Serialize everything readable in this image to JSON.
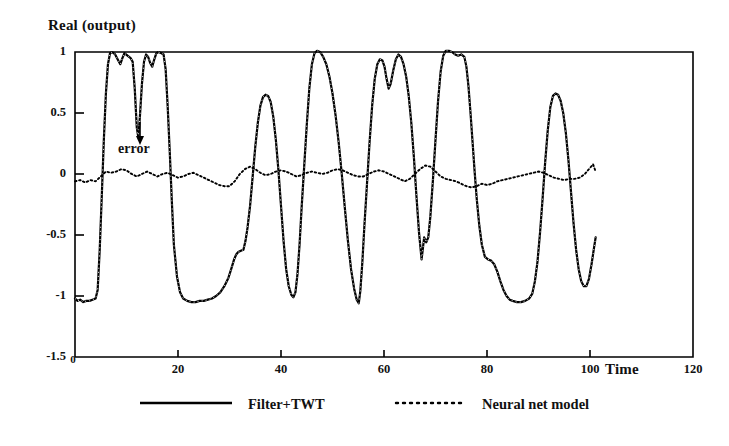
{
  "chart_data": {
    "type": "line",
    "title": "",
    "ylabel": "Real (output)",
    "xlabel": "Time",
    "xlim": [
      0,
      120
    ],
    "ylim": [
      -1.5,
      1.0
    ],
    "xticks": [
      "0",
      "20",
      "40",
      "60",
      "80",
      "100",
      "120"
    ],
    "xtick_values": [
      0,
      20,
      40,
      60,
      80,
      100,
      120
    ],
    "yticks": [
      "1",
      "0.5",
      "0",
      "-0.5",
      "-1",
      "-1.5"
    ],
    "ytick_values": [
      1,
      0.5,
      0,
      -0.5,
      -1,
      -1.5
    ],
    "grid": false,
    "legend_position": "below-axes",
    "annotations": [
      {
        "text": "error",
        "x": 8.5,
        "y": 0.25,
        "points_to": "error-curve"
      }
    ],
    "series": [
      {
        "name": "Filter+TWT",
        "style": "solid",
        "color": "#000000",
        "points": [
          [
            0.0,
            -1.02
          ],
          [
            0.5,
            -1.04
          ],
          [
            1.0,
            -1.03
          ],
          [
            1.6,
            -1.05
          ],
          [
            2.2,
            -1.04
          ],
          [
            2.8,
            -1.04
          ],
          [
            3.4,
            -1.03
          ],
          [
            4.0,
            -1.02
          ],
          [
            4.4,
            -0.95
          ],
          [
            4.8,
            -0.62
          ],
          [
            5.2,
            -0.18
          ],
          [
            5.6,
            0.28
          ],
          [
            6.0,
            0.66
          ],
          [
            6.4,
            0.9
          ],
          [
            6.8,
            0.99
          ],
          [
            7.2,
            1.0
          ],
          [
            7.8,
            0.98
          ],
          [
            8.4,
            0.93
          ],
          [
            8.8,
            0.9
          ],
          [
            9.2,
            0.95
          ],
          [
            9.6,
            0.99
          ],
          [
            10.2,
            0.97
          ],
          [
            10.8,
            0.95
          ],
          [
            11.2,
            0.92
          ],
          [
            11.6,
            0.7
          ],
          [
            12.0,
            0.38
          ],
          [
            12.3,
            0.3
          ],
          [
            12.6,
            0.47
          ],
          [
            13.0,
            0.74
          ],
          [
            13.4,
            0.92
          ],
          [
            13.8,
            0.98
          ],
          [
            14.2,
            0.96
          ],
          [
            14.6,
            0.91
          ],
          [
            15.0,
            0.88
          ],
          [
            15.4,
            0.94
          ],
          [
            15.8,
            0.99
          ],
          [
            16.2,
            1.0
          ],
          [
            16.8,
            0.99
          ],
          [
            17.2,
            0.98
          ],
          [
            17.6,
            0.86
          ],
          [
            18.0,
            0.55
          ],
          [
            18.4,
            0.18
          ],
          [
            18.8,
            -0.22
          ],
          [
            19.2,
            -0.58
          ],
          [
            19.8,
            -0.84
          ],
          [
            20.4,
            -0.97
          ],
          [
            21.0,
            -1.02
          ],
          [
            21.8,
            -1.04
          ],
          [
            22.6,
            -1.05
          ],
          [
            23.4,
            -1.05
          ],
          [
            24.2,
            -1.04
          ],
          [
            25.0,
            -1.04
          ],
          [
            25.8,
            -1.03
          ],
          [
            26.6,
            -1.02
          ],
          [
            27.4,
            -1.0
          ],
          [
            28.2,
            -0.97
          ],
          [
            29.0,
            -0.92
          ],
          [
            29.8,
            -0.85
          ],
          [
            30.4,
            -0.77
          ],
          [
            30.9,
            -0.7
          ],
          [
            31.3,
            -0.66
          ],
          [
            31.7,
            -0.64
          ],
          [
            32.2,
            -0.63
          ],
          [
            32.7,
            -0.62
          ],
          [
            33.1,
            -0.55
          ],
          [
            33.5,
            -0.44
          ],
          [
            34.0,
            -0.26
          ],
          [
            34.5,
            -0.02
          ],
          [
            35.0,
            0.22
          ],
          [
            35.5,
            0.42
          ],
          [
            36.0,
            0.56
          ],
          [
            36.5,
            0.63
          ],
          [
            37.0,
            0.65
          ],
          [
            37.5,
            0.64
          ],
          [
            38.0,
            0.59
          ],
          [
            38.5,
            0.47
          ],
          [
            39.0,
            0.28
          ],
          [
            39.5,
            0.03
          ],
          [
            40.0,
            -0.26
          ],
          [
            40.5,
            -0.55
          ],
          [
            41.0,
            -0.78
          ],
          [
            41.5,
            -0.92
          ],
          [
            42.0,
            -0.99
          ],
          [
            42.4,
            -1.01
          ],
          [
            42.8,
            -0.97
          ],
          [
            43.2,
            -0.82
          ],
          [
            43.6,
            -0.58
          ],
          [
            44.0,
            -0.28
          ],
          [
            44.5,
            0.06
          ],
          [
            45.0,
            0.4
          ],
          [
            45.5,
            0.7
          ],
          [
            46.0,
            0.9
          ],
          [
            46.5,
            0.99
          ],
          [
            47.0,
            1.01
          ],
          [
            47.6,
            1.0
          ],
          [
            48.2,
            0.96
          ],
          [
            48.8,
            0.9
          ],
          [
            49.4,
            0.8
          ],
          [
            50.0,
            0.66
          ],
          [
            50.6,
            0.48
          ],
          [
            51.2,
            0.26
          ],
          [
            51.8,
            0.0
          ],
          [
            52.4,
            -0.28
          ],
          [
            53.0,
            -0.55
          ],
          [
            53.6,
            -0.78
          ],
          [
            54.2,
            -0.94
          ],
          [
            54.7,
            -1.03
          ],
          [
            55.1,
            -1.06
          ],
          [
            55.4,
            -0.96
          ],
          [
            55.8,
            -0.72
          ],
          [
            56.2,
            -0.42
          ],
          [
            56.7,
            -0.08
          ],
          [
            57.2,
            0.26
          ],
          [
            57.7,
            0.56
          ],
          [
            58.2,
            0.78
          ],
          [
            58.7,
            0.9
          ],
          [
            59.2,
            0.94
          ],
          [
            59.7,
            0.93
          ],
          [
            60.1,
            0.88
          ],
          [
            60.5,
            0.78
          ],
          [
            60.9,
            0.7
          ],
          [
            61.3,
            0.74
          ],
          [
            61.8,
            0.85
          ],
          [
            62.3,
            0.94
          ],
          [
            62.8,
            0.98
          ],
          [
            63.3,
            0.96
          ],
          [
            63.8,
            0.9
          ],
          [
            64.3,
            0.8
          ],
          [
            64.8,
            0.64
          ],
          [
            65.3,
            0.42
          ],
          [
            65.8,
            0.14
          ],
          [
            66.3,
            -0.18
          ],
          [
            66.8,
            -0.48
          ],
          [
            67.3,
            -0.7
          ],
          [
            67.8,
            -0.52
          ],
          [
            68.2,
            -0.56
          ],
          [
            68.6,
            -0.52
          ],
          [
            69.0,
            -0.35
          ],
          [
            69.5,
            -0.05
          ],
          [
            70.0,
            0.28
          ],
          [
            70.5,
            0.6
          ],
          [
            71.0,
            0.84
          ],
          [
            71.5,
            0.97
          ],
          [
            72.0,
            1.01
          ],
          [
            72.6,
            1.01
          ],
          [
            73.2,
            1.0
          ],
          [
            73.8,
            0.98
          ],
          [
            74.4,
            0.97
          ],
          [
            75.0,
            0.98
          ],
          [
            75.6,
            0.96
          ],
          [
            76.0,
            0.88
          ],
          [
            76.4,
            0.72
          ],
          [
            76.8,
            0.5
          ],
          [
            77.2,
            0.26
          ],
          [
            77.6,
            0.02
          ],
          [
            78.0,
            -0.2
          ],
          [
            78.5,
            -0.42
          ],
          [
            79.0,
            -0.58
          ],
          [
            79.6,
            -0.68
          ],
          [
            80.2,
            -0.7
          ],
          [
            80.8,
            -0.71
          ],
          [
            81.4,
            -0.74
          ],
          [
            82.0,
            -0.8
          ],
          [
            82.6,
            -0.88
          ],
          [
            83.2,
            -0.95
          ],
          [
            83.8,
            -1.0
          ],
          [
            84.4,
            -1.03
          ],
          [
            85.0,
            -1.04
          ],
          [
            85.8,
            -1.05
          ],
          [
            86.6,
            -1.05
          ],
          [
            87.4,
            -1.04
          ],
          [
            88.2,
            -1.02
          ],
          [
            88.8,
            -0.98
          ],
          [
            89.3,
            -0.88
          ],
          [
            89.8,
            -0.72
          ],
          [
            90.3,
            -0.48
          ],
          [
            90.8,
            -0.2
          ],
          [
            91.3,
            0.1
          ],
          [
            91.8,
            0.36
          ],
          [
            92.3,
            0.55
          ],
          [
            92.8,
            0.64
          ],
          [
            93.3,
            0.66
          ],
          [
            93.8,
            0.65
          ],
          [
            94.3,
            0.6
          ],
          [
            94.8,
            0.5
          ],
          [
            95.3,
            0.34
          ],
          [
            95.8,
            0.12
          ],
          [
            96.3,
            -0.14
          ],
          [
            96.8,
            -0.4
          ],
          [
            97.3,
            -0.62
          ],
          [
            97.8,
            -0.78
          ],
          [
            98.3,
            -0.88
          ],
          [
            98.8,
            -0.92
          ],
          [
            99.3,
            -0.92
          ],
          [
            99.8,
            -0.86
          ],
          [
            100.3,
            -0.74
          ],
          [
            100.8,
            -0.6
          ],
          [
            101.1,
            -0.52
          ]
        ]
      },
      {
        "name": "Neural net model",
        "style": "dotted",
        "color": "#000000",
        "description": "error curve, near zero baseline",
        "points": [
          [
            0.0,
            -0.06
          ],
          [
            1.0,
            -0.05
          ],
          [
            2.0,
            -0.07
          ],
          [
            3.0,
            -0.05
          ],
          [
            4.0,
            -0.06
          ],
          [
            5.0,
            -0.02
          ],
          [
            6.0,
            0.02
          ],
          [
            7.0,
            0.01
          ],
          [
            8.0,
            0.02
          ],
          [
            9.0,
            0.04
          ],
          [
            10.0,
            0.03
          ],
          [
            11.0,
            0.0
          ],
          [
            12.0,
            -0.02
          ],
          [
            13.0,
            0.0
          ],
          [
            14.0,
            0.02
          ],
          [
            15.0,
            0.0
          ],
          [
            16.0,
            -0.02
          ],
          [
            17.0,
            0.0
          ],
          [
            18.0,
            0.01
          ],
          [
            19.0,
            -0.01
          ],
          [
            20.0,
            -0.03
          ],
          [
            21.0,
            -0.02
          ],
          [
            22.0,
            0.0
          ],
          [
            23.0,
            0.01
          ],
          [
            24.0,
            -0.01
          ],
          [
            25.0,
            -0.03
          ],
          [
            26.0,
            -0.05
          ],
          [
            27.0,
            -0.07
          ],
          [
            28.0,
            -0.09
          ],
          [
            29.0,
            -0.1
          ],
          [
            30.0,
            -0.1
          ],
          [
            31.0,
            -0.06
          ],
          [
            32.0,
            0.0
          ],
          [
            33.0,
            0.04
          ],
          [
            34.0,
            0.06
          ],
          [
            35.0,
            0.04
          ],
          [
            36.0,
            0.01
          ],
          [
            37.0,
            -0.01
          ],
          [
            38.0,
            0.0
          ],
          [
            39.0,
            0.02
          ],
          [
            40.0,
            0.03
          ],
          [
            41.0,
            0.02
          ],
          [
            42.0,
            0.0
          ],
          [
            43.0,
            -0.02
          ],
          [
            44.0,
            -0.01
          ],
          [
            45.0,
            0.01
          ],
          [
            46.0,
            0.02
          ],
          [
            47.0,
            0.01
          ],
          [
            48.0,
            0.0
          ],
          [
            49.0,
            0.01
          ],
          [
            50.0,
            0.03
          ],
          [
            51.0,
            0.04
          ],
          [
            52.0,
            0.03
          ],
          [
            53.0,
            0.01
          ],
          [
            54.0,
            -0.01
          ],
          [
            55.0,
            -0.02
          ],
          [
            56.0,
            -0.02
          ],
          [
            57.0,
            0.0
          ],
          [
            58.0,
            0.02
          ],
          [
            59.0,
            0.03
          ],
          [
            60.0,
            0.02
          ],
          [
            61.0,
            0.0
          ],
          [
            62.0,
            -0.02
          ],
          [
            63.0,
            -0.04
          ],
          [
            64.0,
            -0.06
          ],
          [
            65.0,
            -0.04
          ],
          [
            66.0,
            0.0
          ],
          [
            67.0,
            0.04
          ],
          [
            68.0,
            0.07
          ],
          [
            69.0,
            0.06
          ],
          [
            70.0,
            0.02
          ],
          [
            71.0,
            -0.02
          ],
          [
            72.0,
            -0.04
          ],
          [
            73.0,
            -0.05
          ],
          [
            74.0,
            -0.06
          ],
          [
            75.0,
            -0.08
          ],
          [
            76.0,
            -0.1
          ],
          [
            77.0,
            -0.11
          ],
          [
            78.0,
            -0.1
          ],
          [
            79.0,
            -0.08
          ],
          [
            80.0,
            -0.09
          ],
          [
            81.0,
            -0.08
          ],
          [
            82.0,
            -0.06
          ],
          [
            83.0,
            -0.05
          ],
          [
            84.0,
            -0.04
          ],
          [
            85.0,
            -0.03
          ],
          [
            86.0,
            -0.02
          ],
          [
            87.0,
            -0.01
          ],
          [
            88.0,
            0.0
          ],
          [
            89.0,
            0.01
          ],
          [
            90.0,
            0.02
          ],
          [
            91.0,
            0.01
          ],
          [
            92.0,
            -0.01
          ],
          [
            93.0,
            -0.03
          ],
          [
            94.0,
            -0.04
          ],
          [
            95.0,
            -0.05
          ],
          [
            96.0,
            -0.04
          ],
          [
            97.0,
            -0.04
          ],
          [
            98.0,
            -0.03
          ],
          [
            99.0,
            0.0
          ],
          [
            100.0,
            0.05
          ],
          [
            100.6,
            0.08
          ],
          [
            101.1,
            0.02
          ]
        ]
      }
    ],
    "legend": [
      {
        "label": "Filter+TWT",
        "style": "solid"
      },
      {
        "label": "Neural net model",
        "style": "dotted"
      }
    ]
  }
}
